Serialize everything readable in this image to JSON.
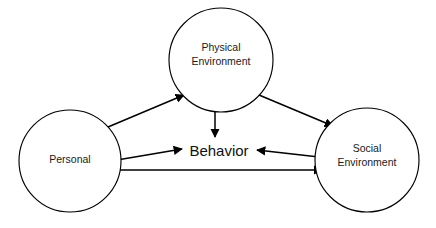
{
  "diagram": {
    "background_color": "#ffffff",
    "line_color": "#000000",
    "text_color": "#1a1a1a",
    "nodes": [
      {
        "id": "physical-environment",
        "label_line1": "Physical",
        "label_line2": "Environment",
        "shape": "circle",
        "cx": 221,
        "cy": 60,
        "r": 52
      },
      {
        "id": "personal",
        "label_line1": "Personal",
        "label_line2": "",
        "shape": "circle",
        "cx": 70,
        "cy": 161,
        "r": 51
      },
      {
        "id": "social-environment",
        "label_line1": "Social",
        "label_line2": "Environment",
        "shape": "circle",
        "cx": 367,
        "cy": 160,
        "r": 52
      }
    ],
    "center_node": {
      "id": "behavior",
      "label": "Behavior",
      "x": 219,
      "y": 152
    },
    "connections": [
      {
        "id": "personal-physical",
        "from": "personal",
        "to": "physical-environment",
        "direction": "bidirectional"
      },
      {
        "id": "physical-social",
        "from": "physical-environment",
        "to": "social-environment",
        "direction": "bidirectional"
      },
      {
        "id": "physical-behavior",
        "from": "physical-environment",
        "to": "behavior",
        "direction": "bidirectional"
      },
      {
        "id": "personal-behavior",
        "from": "personal",
        "to": "behavior",
        "direction": "bidirectional"
      },
      {
        "id": "social-behavior",
        "from": "social-environment",
        "to": "behavior",
        "direction": "unidirectional"
      },
      {
        "id": "personal-social",
        "from": "personal",
        "to": "social-environment",
        "direction": "bidirectional"
      }
    ]
  }
}
